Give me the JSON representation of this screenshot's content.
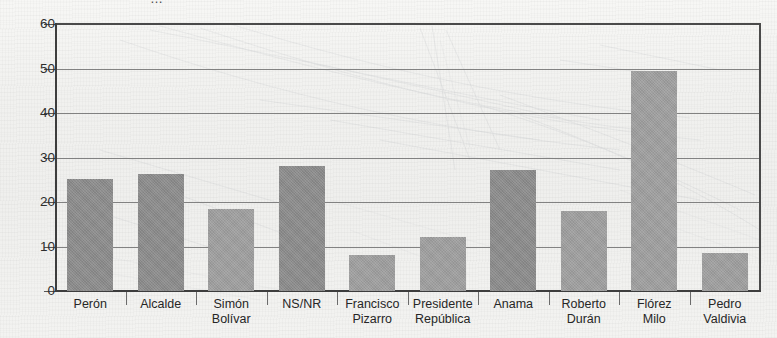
{
  "chart_data": {
    "type": "bar",
    "title": "",
    "xlabel": "",
    "ylabel": "",
    "ylim": [
      0,
      60
    ],
    "yticks": [
      0,
      10,
      20,
      30,
      40,
      50,
      60
    ],
    "grid": true,
    "legend": "none",
    "categories": [
      "Perón",
      "Alcalde",
      "Simón Bolívar",
      "NS/NR",
      "Francisco Pizarro",
      "Presidente República",
      "Anama",
      "Roberto Durán",
      "Flórez Milo",
      "Pedro Valdivia"
    ],
    "category_lines": [
      [
        "Perón"
      ],
      [
        "Alcalde"
      ],
      [
        "Simón",
        "Bolívar"
      ],
      [
        "NS/NR"
      ],
      [
        "Francisco",
        "Pizarro"
      ],
      [
        "Presidente",
        "República"
      ],
      [
        "Anama"
      ],
      [
        "Roberto",
        "Durán"
      ],
      [
        "Flórez",
        "Milo"
      ],
      [
        "Pedro",
        "Valdivia"
      ]
    ],
    "values": [
      25.2,
      26.2,
      18.5,
      28.0,
      8.2,
      12.1,
      27.3,
      18.0,
      49.5,
      8.5
    ],
    "bar_shades": [
      "dark",
      "dark",
      "light",
      "dark",
      "light",
      "light",
      "dark",
      "light",
      "light",
      "light"
    ]
  },
  "style": {
    "bar_dark": "#8a8a8a",
    "bar_light": "#9d9d9d",
    "axis_color": "#3d3d3d",
    "grid_color": "#6e6e6e",
    "text_color": "#262626",
    "page_background": "#f1f1ef"
  },
  "title_fragment": "…"
}
